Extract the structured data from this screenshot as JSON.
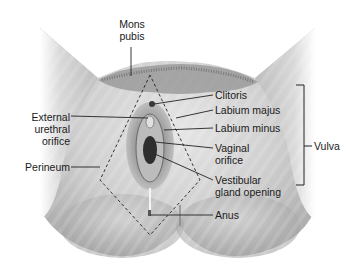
{
  "figure": {
    "colors": {
      "skin_light": "#f2f2f2",
      "skin_mid": "#c8c8c8",
      "skin_dark": "#8a8a8a",
      "hair": "#6e6e6e",
      "line": "#222222",
      "background": "#ffffff"
    }
  },
  "labels": {
    "mons_pubis_1": "Mons",
    "mons_pubis_2": "pubis",
    "clitoris": "Clitoris",
    "labium_majus": "Labium majus",
    "labium_minus": "Labium minus",
    "vaginal_orifice_1": "Vaginal",
    "vaginal_orifice_2": "orifice",
    "vestibular_1": "Vestibular",
    "vestibular_2": "gland opening",
    "anus": "Anus",
    "external_1": "External",
    "external_2": "urethral",
    "external_3": "orifice",
    "perineum": "Perineum",
    "vulva": "Vulva"
  },
  "bracket": {
    "label": "Vulva",
    "spans": [
      "Clitoris",
      "Labium majus",
      "Labium minus",
      "Vaginal orifice",
      "Vestibular gland opening"
    ]
  }
}
